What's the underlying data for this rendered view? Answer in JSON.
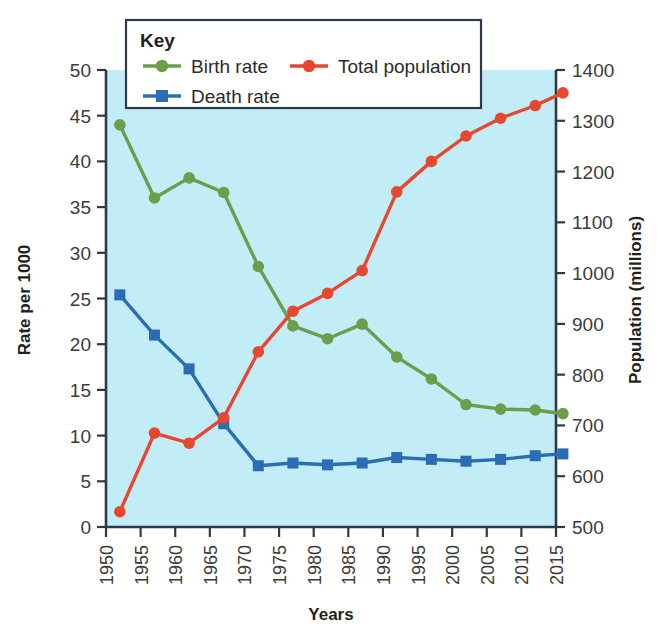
{
  "chart_data": {
    "type": "line",
    "title": "",
    "xlabel": "Years",
    "ylabel": "Rate per 1000",
    "y2label": "Population (millions)",
    "grid": false,
    "legend_position": "top-center",
    "legend_title": "Key",
    "x": [
      1952,
      1957,
      1962,
      1967,
      1972,
      1977,
      1982,
      1987,
      1992,
      1997,
      2002,
      2007,
      2012,
      2016
    ],
    "xtick_labels": [
      "1950",
      "1955",
      "1960",
      "1965",
      "1970",
      "1975",
      "1980",
      "1985",
      "1990",
      "1995",
      "2000",
      "2005",
      "2010",
      "2015"
    ],
    "xlim": [
      1950,
      2015
    ],
    "ylim": [
      0,
      50
    ],
    "ytick_labels": [
      "0",
      "5",
      "10",
      "15",
      "20",
      "25",
      "30",
      "35",
      "40",
      "45",
      "50"
    ],
    "y2lim": [
      500,
      1400
    ],
    "y2tick_labels": [
      "500",
      "600",
      "700",
      "800",
      "900",
      "1000",
      "1100",
      "1200",
      "1300",
      "1400"
    ],
    "series": [
      {
        "name": "Birth rate",
        "axis": "left",
        "color": "#6c9d4b",
        "marker": "circle",
        "values": [
          44.0,
          36.0,
          38.2,
          36.6,
          28.5,
          22.0,
          20.6,
          22.2,
          18.6,
          16.2,
          13.4,
          12.9,
          12.8,
          12.4
        ]
      },
      {
        "name": "Death rate",
        "axis": "left",
        "color": "#2a6db5",
        "marker": "square",
        "values": [
          25.4,
          21.0,
          17.3,
          11.3,
          6.7,
          7.0,
          6.8,
          7.0,
          7.6,
          7.4,
          7.2,
          7.4,
          7.8,
          8.0
        ]
      },
      {
        "name": "Total population",
        "axis": "right",
        "color": "#e8472f",
        "marker": "circle",
        "values": [
          530,
          685,
          665,
          715,
          845,
          925,
          960,
          1005,
          1160,
          1220,
          1270,
          1305,
          1330,
          1355
        ]
      }
    ]
  },
  "legend": {
    "title": "Key",
    "entries": [
      {
        "label": "Birth rate",
        "color": "#6c9d4b",
        "marker": "circle"
      },
      {
        "label": "Total population",
        "color": "#e8472f",
        "marker": "circle"
      },
      {
        "label": "Death rate",
        "color": "#2a6db5",
        "marker": "square"
      }
    ]
  },
  "axes": {
    "left_title": "Rate per 1000",
    "right_title": "Population (millions)",
    "bottom_title": "Years"
  },
  "colors": {
    "plot_background": "#c2edf6",
    "axis": "#2b3a46",
    "birth_rate": "#6c9d4b",
    "death_rate": "#2a6db5",
    "total_population": "#e8472f"
  }
}
